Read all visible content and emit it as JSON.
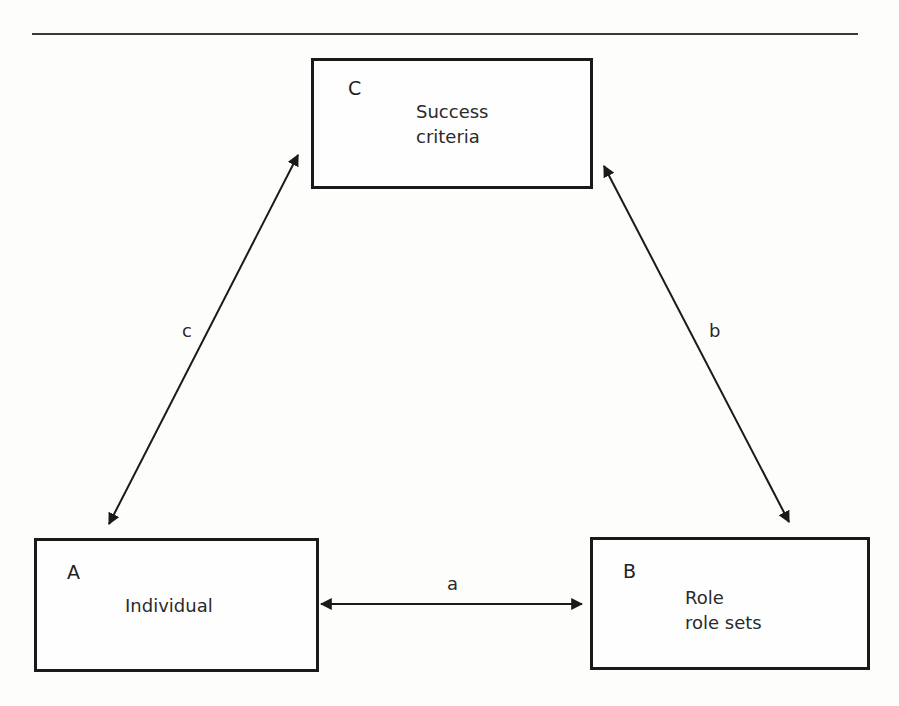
{
  "diagram": {
    "nodes": [
      {
        "id": "C",
        "letter": "C",
        "line1": "Success",
        "line2": "criteria"
      },
      {
        "id": "A",
        "letter": "A",
        "line1": "Individual",
        "line2": ""
      },
      {
        "id": "B",
        "letter": "B",
        "line1": "Role",
        "line2": "role sets"
      }
    ],
    "edges": [
      {
        "id": "a",
        "label": "a",
        "from": "A",
        "to": "B",
        "bidirectional": true
      },
      {
        "id": "b",
        "label": "b",
        "from": "C",
        "to": "B",
        "bidirectional": true
      },
      {
        "id": "c",
        "label": "c",
        "from": "C",
        "to": "A",
        "bidirectional": true
      }
    ],
    "colors": {
      "line": "#1a1a1a",
      "background": "#fdfdfb"
    }
  }
}
